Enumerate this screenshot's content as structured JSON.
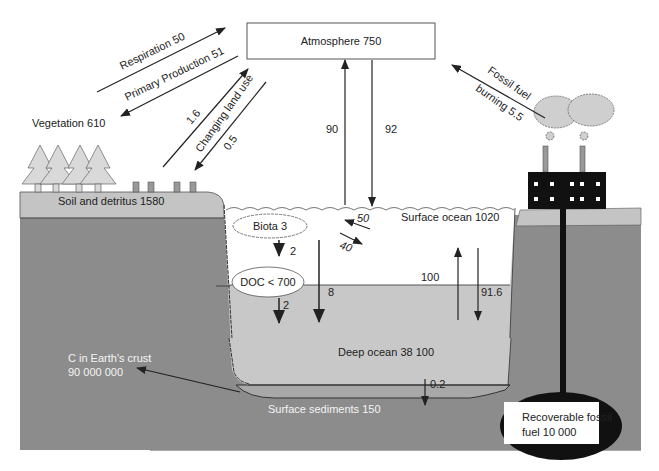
{
  "diagram": {
    "reservoirs": {
      "atmosphere": "Atmosphere 750",
      "vegetation": "Vegetation 610",
      "soil": "Soil and detritus 1580",
      "surface_ocean": "Surface ocean 1020",
      "biota": "Biota 3",
      "doc": "DOC < 700",
      "deep_ocean": "Deep ocean 38 100",
      "sediments": "Surface sediments 150",
      "crust_line1": "C in Earth's crust",
      "crust_line2": "90 000 000",
      "fossil_line1": "Recoverable fossil",
      "fossil_line2": "fuel 10 000"
    },
    "fluxes": {
      "respiration": "Respiration 50",
      "primary_production": "Primary Production 51",
      "land_use_up": "1.6",
      "changing_land_use": "Changing land use",
      "land_use_down": "0.5",
      "fossil_burning_line1": "Fossil fuel",
      "fossil_burning_line2": "burning 5.5",
      "ocean_up": "90",
      "ocean_down": "92",
      "biota_in": "50",
      "biota_out": "40",
      "biota_to_doc": "2",
      "doc_down": "2",
      "biota_to_deep": "8",
      "mixing_up": "100",
      "mixing_down": "91.6",
      "sedimentation": "0.2"
    },
    "colors": {
      "crust": "#8c8c8c",
      "soil": "#c4c4c4",
      "deep_ocean": "#c8c8c8",
      "surface_ocean": "#ffffff",
      "trees": "#d9d9d9",
      "factory": "#111111",
      "clouds": "#cfcfcf"
    }
  }
}
